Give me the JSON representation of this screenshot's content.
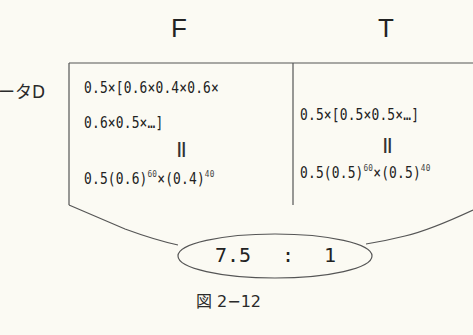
{
  "headers": {
    "f": "F",
    "t": "T"
  },
  "row_label": "ータD",
  "f_cell": {
    "line1": "0.5×[0.6×0.4×0.6×",
    "line2": "0.6×0.5×…]",
    "equals": "॥",
    "formula_base1": "0.5(0.6)",
    "formula_exp1": "60",
    "formula_mid": "×(0.4)",
    "formula_exp2": "40"
  },
  "t_cell": {
    "line1": "0.5×[0.5×0.5×…]",
    "equals": "॥",
    "formula_base1": "0.5(0.5)",
    "formula_exp1": "60",
    "formula_mid": "×(0.5)",
    "formula_exp2": "40"
  },
  "ratio": {
    "left": "7.5",
    "separator": ":",
    "right": "1"
  },
  "caption": "図 2−12"
}
